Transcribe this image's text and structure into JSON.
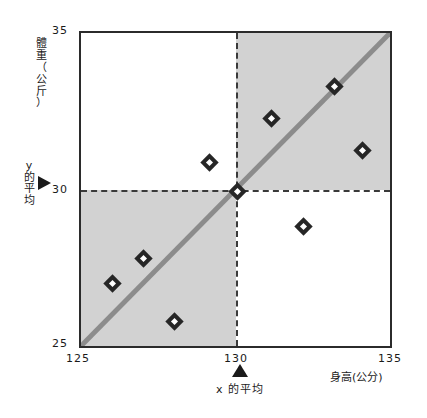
{
  "chart_data": {
    "type": "scatter",
    "title": "",
    "xlabel": "身高(公分)",
    "ylabel": "體重（公斤）",
    "xlim": [
      125,
      135
    ],
    "ylim": [
      25,
      35
    ],
    "xticks": [
      125,
      130,
      135
    ],
    "yticks": [
      25,
      30,
      35
    ],
    "xtick_labels": [
      "125",
      "130",
      "135"
    ],
    "ytick_labels": [
      "25",
      "30",
      "35"
    ],
    "grid": false,
    "legend": null,
    "points": [
      {
        "x": 126.0,
        "y": 27.1
      },
      {
        "x": 127.0,
        "y": 27.9
      },
      {
        "x": 128.0,
        "y": 25.9
      },
      {
        "x": 129.1,
        "y": 30.9
      },
      {
        "x": 130.0,
        "y": 30.0
      },
      {
        "x": 131.1,
        "y": 32.3
      },
      {
        "x": 132.1,
        "y": 28.9
      },
      {
        "x": 133.1,
        "y": 33.3
      },
      {
        "x": 134.0,
        "y": 31.3
      }
    ],
    "trend_line": {
      "x0": 125,
      "y0": 25,
      "x1": 135,
      "y1": 35
    },
    "mean_x": 130,
    "mean_y": 30,
    "mean_x_label": "x 的平均",
    "mean_y_label": "y 的平均",
    "shaded_quadrants": [
      "upper-right",
      "lower-left"
    ],
    "shade_color": "#d2d2d2",
    "line_color": "#8c8c8c",
    "marker_color": "#262626",
    "axis_color": "#2b2b2b"
  },
  "axes": {
    "y_title_chars": [
      "體",
      "重",
      "（",
      "公",
      "分",
      "）"
    ],
    "y_title_display": [
      "體",
      "重",
      "（",
      "公",
      "斤",
      "）"
    ],
    "x_title": "身高(公分)",
    "y_tick_top": "35",
    "y_tick_mid": "30",
    "y_tick_bottom": "25",
    "x_tick_left": "125",
    "x_tick_mid": "130",
    "x_tick_right": "135"
  },
  "annotations": {
    "y_mean": {
      "lines": [
        "y",
        "的",
        "平",
        "均"
      ]
    },
    "x_mean": {
      "text": "x 的平均"
    }
  }
}
